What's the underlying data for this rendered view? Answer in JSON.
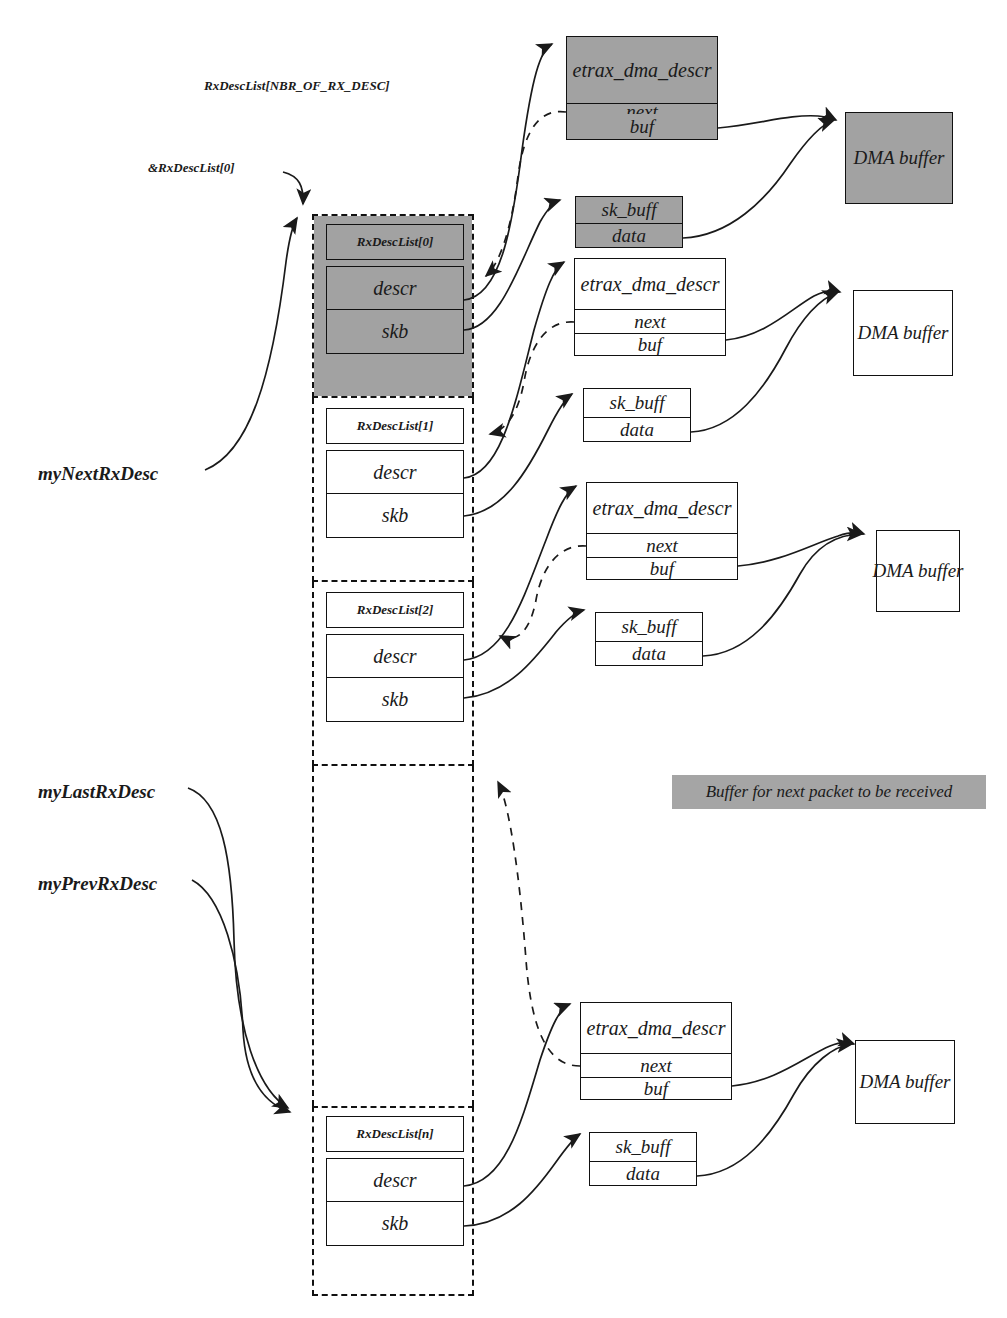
{
  "diagram": {
    "title": "RxDescList[NBR_OF_RX_DESC]",
    "caption": "",
    "colors": {
      "shade": "#a2a2a2",
      "stroke": "#111111",
      "legend_bg": "#a5a5a5"
    }
  },
  "pointer_labels": {
    "head": "&RxDescList[0]",
    "next_rx": "myNextRxDesc",
    "last_rx": "myLastRxDesc",
    "prev_rx": "myPrevRxDesc"
  },
  "legend": {
    "text": "Buffer for next packet to be received"
  },
  "fields": {
    "descr": "descr",
    "skb": "skb",
    "etrax": "etrax_dma_descr",
    "next": "next",
    "buf": "buf",
    "skbuff": "sk_buff",
    "data": "data",
    "dma": "DMA buffer"
  },
  "entries": [
    {
      "index_label": "RxDescList[0]",
      "shaded": true
    },
    {
      "index_label": "RxDescList[1]",
      "shaded": false
    },
    {
      "index_label": "RxDescList[2]",
      "shaded": false
    },
    {
      "index_label": "RxDescList[n]",
      "shaded": false
    }
  ],
  "groups": [
    {
      "descr_title": "etrax_dma_descr",
      "next": "next",
      "buf": "buf",
      "skbuff_title": "sk_buff",
      "data": "data",
      "dma": "DMA buffer",
      "shaded": true
    },
    {
      "descr_title": "etrax_dma_descr",
      "next": "next",
      "buf": "buf",
      "skbuff_title": "sk_buff",
      "data": "data",
      "dma": "DMA buffer",
      "shaded": false
    },
    {
      "descr_title": "etrax_dma_descr",
      "next": "next",
      "buf": "buf",
      "skbuff_title": "sk_buff",
      "data": "data",
      "dma": "DMA buffer",
      "shaded": false
    },
    {
      "descr_title": "etrax_dma_descr",
      "next": "next",
      "buf": "buf",
      "skbuff_title": "sk_buff",
      "data": "data",
      "dma": "DMA buffer",
      "shaded": false
    }
  ]
}
